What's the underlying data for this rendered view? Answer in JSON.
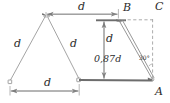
{
  "figure": {
    "background_color": "#ffffff",
    "line_color": "#8a8a8a",
    "label_color": "#2b2b2b",
    "dash_color": "#9a9a9a"
  },
  "points": {
    "A": {
      "label": "A",
      "x": 152,
      "y": 80
    },
    "B": {
      "label": "B",
      "x": 118,
      "y": 14
    },
    "C": {
      "label": "C",
      "x": 152,
      "y": 14
    },
    "apex": {
      "x": 46,
      "y": 14
    },
    "base_left": {
      "x": 10,
      "y": 82
    },
    "base_right": {
      "x": 79,
      "y": 80
    }
  },
  "dimensions": {
    "top": {
      "label": "d",
      "value": "d",
      "from": "apex",
      "to": "B"
    },
    "left_side": {
      "label": "d",
      "value": "d"
    },
    "right_side": {
      "label": "d",
      "value": "d"
    },
    "base": {
      "label": "d",
      "value": "d"
    },
    "link_BA": {
      "label": "d",
      "value": "d"
    },
    "vertical": {
      "label": "0,87d",
      "value": "0,87d"
    }
  },
  "angles": {
    "at_A": {
      "label": "30",
      "unit": "°",
      "text": "30°",
      "value": 30
    }
  }
}
